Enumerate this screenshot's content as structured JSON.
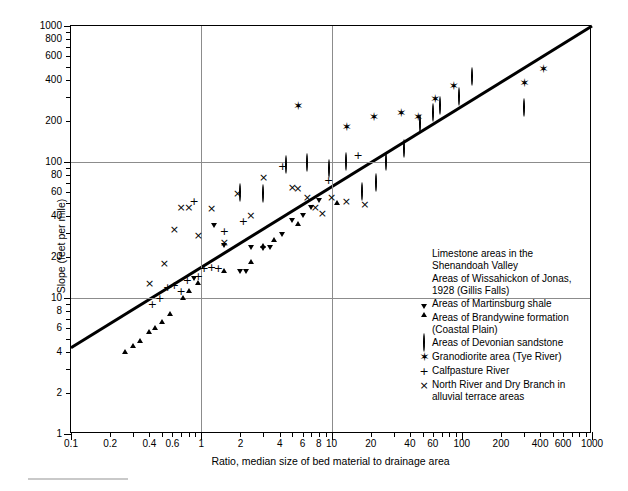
{
  "axes": {
    "ytitle": "Slope (feet per mile)",
    "xtitle": "Ratio, median size of bed material to drainage area",
    "ylabels": [
      "1",
      "2",
      "4",
      "6",
      "8",
      "10",
      "20",
      "40",
      "60",
      "80",
      "100",
      "200",
      "400",
      "600",
      "800",
      "1000"
    ],
    "xlabels": [
      "0.1",
      "0.2",
      "0.4",
      "0.6",
      "1",
      "2",
      "4",
      "6",
      "8",
      "10",
      "20",
      "40",
      "60",
      "100",
      "200",
      "400",
      "600",
      "1000"
    ]
  },
  "legend": {
    "items": [
      {
        "marker": "filled-circle",
        "label": "Limestone areas in the Shenandoah Valley"
      },
      {
        "marker": "filled-square",
        "label": "Areas of Wissahickon of Jonas, 1928 (Gillis Falls)"
      },
      {
        "marker": "filled-up-triangle",
        "label": "Areas of Martinsburg shale"
      },
      {
        "marker": "filled-down-triangle",
        "label": "Areas of Brandywine formation (Coastal Plain)"
      },
      {
        "marker": "open-circle",
        "label": "Areas of Devonian sandstone"
      },
      {
        "marker": "star",
        "label": "Granodiorite area (Tye River)"
      },
      {
        "marker": "plus",
        "label": "Calfpasture River"
      },
      {
        "marker": "cross",
        "label": "North River and Dry Branch in alluvial terrace areas"
      }
    ]
  },
  "chart_data": {
    "type": "scatter",
    "title": "",
    "xlabel": "Ratio, median size of bed material to drainage area",
    "ylabel": "Slope (feet per mile)",
    "xscale": "log",
    "yscale": "log",
    "xlim": [
      0.1,
      1000
    ],
    "ylim": [
      1,
      1000
    ],
    "grid": "major lines at x=1, x=10, y=10, y=100",
    "legend_position": "inside lower-right",
    "trendline": {
      "x": [
        0.1,
        1000
      ],
      "y": [
        4.3,
        1000
      ],
      "style": "solid thick black"
    },
    "series": [
      {
        "name": "Limestone areas in the Shenandoah Valley",
        "marker": "filled-circle",
        "points": [
          [
            0.105,
            3.8
          ],
          [
            0.23,
            5.0
          ],
          [
            0.27,
            5.6
          ],
          [
            0.3,
            6.2
          ],
          [
            0.33,
            6.0
          ],
          [
            0.36,
            7.0
          ],
          [
            0.4,
            8.0
          ],
          [
            0.42,
            9.2
          ],
          [
            0.44,
            7.6
          ],
          [
            0.48,
            8.2
          ],
          [
            0.52,
            9.0
          ],
          [
            0.55,
            10.0
          ],
          [
            0.58,
            6.0
          ],
          [
            0.62,
            6.1
          ],
          [
            0.7,
            11.5
          ],
          [
            0.78,
            12.5
          ],
          [
            0.84,
            12.8
          ],
          [
            0.95,
            9.6
          ],
          [
            1.05,
            16.0
          ],
          [
            1.2,
            18.0
          ],
          [
            1.3,
            8.0
          ],
          [
            1.5,
            21.0
          ],
          [
            1.55,
            28.0
          ],
          [
            1.75,
            29.0
          ],
          [
            1.9,
            41.0
          ],
          [
            2.1,
            25.0
          ],
          [
            2.3,
            19.5
          ],
          [
            2.6,
            30.0
          ],
          [
            3.0,
            23.0
          ],
          [
            3.3,
            34.0
          ],
          [
            4.0,
            46.0
          ],
          [
            5.0,
            26.0
          ],
          [
            5.5,
            36.0
          ],
          [
            6.0,
            33.0
          ],
          [
            7.0,
            56.0
          ],
          [
            8.5,
            78.0
          ],
          [
            9.5,
            60.0
          ],
          [
            11.0,
            66.0
          ],
          [
            13.0,
            80.0
          ],
          [
            17.0,
            92.0
          ],
          [
            22.0,
            140.0
          ],
          [
            26.0,
            86.0
          ],
          [
            33.0,
            100.0
          ]
        ]
      },
      {
        "name": "Areas of Wissahickon of Jonas, 1928 (Gillis Falls)",
        "marker": "filled-square",
        "points": [
          [
            1.05,
            13.0
          ],
          [
            1.45,
            18.0
          ],
          [
            1.5,
            11.5
          ],
          [
            1.7,
            11.0
          ],
          [
            1.95,
            15.0
          ],
          [
            2.3,
            14.0
          ],
          [
            2.8,
            21.0
          ],
          [
            3.2,
            21.0
          ],
          [
            3.6,
            24.0
          ],
          [
            4.6,
            31.5
          ],
          [
            5.0,
            28.0
          ],
          [
            5.5,
            46.0
          ],
          [
            7.0,
            42.0
          ],
          [
            8.0,
            42.0
          ],
          [
            9.0,
            44.0
          ],
          [
            12.0,
            52.0
          ],
          [
            16.0,
            55.0
          ],
          [
            22.0,
            88.0
          ],
          [
            26.0,
            97.0
          ],
          [
            34.0,
            130.0
          ],
          [
            45.0,
            125.0
          ]
        ]
      },
      {
        "name": "Areas of Martinsburg shale",
        "marker": "filled-up-triangle",
        "points": [
          [
            0.26,
            4.8
          ],
          [
            0.3,
            5.3
          ],
          [
            0.34,
            5.8
          ],
          [
            0.4,
            6.8
          ],
          [
            0.44,
            7.2
          ],
          [
            0.5,
            8.0
          ],
          [
            0.58,
            9.2
          ],
          [
            0.72,
            12.0
          ],
          [
            0.8,
            13.5
          ],
          [
            0.95,
            15.5
          ],
          [
            1.5,
            19.0
          ],
          [
            2.4,
            22.0
          ],
          [
            3.0,
            29.0
          ],
          [
            3.6,
            32.0
          ],
          [
            5.5,
            42.0
          ],
          [
            11.0,
            60.0
          ]
        ]
      },
      {
        "name": "Areas of Brandywine formation (Coastal Plain)",
        "marker": "filled-down-triangle",
        "points": [
          [
            0.88,
            11.5
          ],
          [
            1.5,
            20.0
          ],
          [
            2.0,
            13.0
          ],
          [
            2.2,
            12.8
          ],
          [
            2.4,
            19.5
          ],
          [
            3.0,
            19.0
          ],
          [
            3.4,
            19.5
          ],
          [
            4.2,
            24.0
          ],
          [
            5.0,
            30.5
          ],
          [
            6.0,
            33.0
          ],
          [
            7.0,
            38.0
          ],
          [
            8.0,
            43.0
          ],
          [
            1.25,
            28.0
          ]
        ]
      },
      {
        "name": "Areas of Devonian sandstone",
        "marker": "open-circle",
        "points": [
          [
            2.0,
            59.0
          ],
          [
            3.0,
            58.0
          ],
          [
            4.5,
            95.0
          ],
          [
            6.5,
            99.0
          ],
          [
            9.5,
            89.0
          ],
          [
            13.0,
            100.0
          ],
          [
            17.0,
            60.0
          ],
          [
            22.0,
            70.0
          ],
          [
            26.0,
            100.0
          ],
          [
            36.0,
            125.0
          ],
          [
            48.0,
            190.0
          ],
          [
            60.0,
            230.0
          ],
          [
            68.0,
            260.0
          ],
          [
            95.0,
            300.0
          ],
          [
            120.0,
            420.0
          ],
          [
            300.0,
            250.0
          ]
        ]
      },
      {
        "name": "Granodiorite area (Tye River)",
        "marker": "star",
        "points": [
          [
            5.5,
            260.0
          ],
          [
            13.0,
            180.0
          ],
          [
            21.0,
            215.0
          ],
          [
            34.0,
            230.0
          ],
          [
            46.0,
            215.0
          ],
          [
            62.0,
            290.0
          ],
          [
            86.0,
            360.0
          ],
          [
            300.0,
            380.0
          ],
          [
            420.0,
            480.0
          ]
        ]
      },
      {
        "name": "Calfpasture River",
        "marker": "plus",
        "points": [
          [
            0.42,
            9.0
          ],
          [
            0.48,
            10.0
          ],
          [
            0.55,
            12.0
          ],
          [
            0.62,
            12.5
          ],
          [
            0.7,
            11.2
          ],
          [
            0.78,
            13.5
          ],
          [
            0.88,
            52.0
          ],
          [
            0.95,
            14.5
          ],
          [
            1.05,
            16.5
          ],
          [
            1.2,
            17.0
          ],
          [
            1.35,
            16.5
          ],
          [
            1.5,
            31.0
          ],
          [
            2.1,
            37.0
          ],
          [
            4.2,
            93.0
          ],
          [
            9.5,
            74.0
          ],
          [
            16.0,
            113.0
          ]
        ]
      },
      {
        "name": "North River and Dry Branch in alluvial terrace areas",
        "marker": "cross",
        "points": [
          [
            0.4,
            13.0
          ],
          [
            0.52,
            18.0
          ],
          [
            0.62,
            32.0
          ],
          [
            0.7,
            47.0
          ],
          [
            0.8,
            47.0
          ],
          [
            0.95,
            29.0
          ],
          [
            1.2,
            46.0
          ],
          [
            1.5,
            26.0
          ],
          [
            1.9,
            59.0
          ],
          [
            2.4,
            41.0
          ],
          [
            3.0,
            78.0
          ],
          [
            5.0,
            66.0
          ],
          [
            5.5,
            64.0
          ],
          [
            6.5,
            55.0
          ],
          [
            7.5,
            47.0
          ],
          [
            8.5,
            42.0
          ],
          [
            10.0,
            55.0
          ],
          [
            13.0,
            52.0
          ],
          [
            18.0,
            49.0
          ]
        ]
      }
    ]
  }
}
